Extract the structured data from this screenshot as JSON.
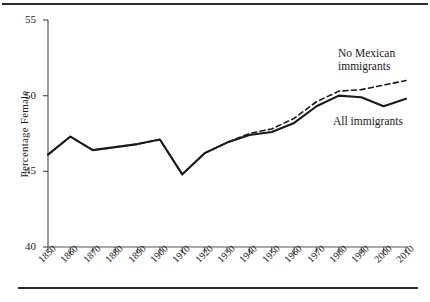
{
  "figure": {
    "ylabel": "Percentage Female",
    "ytick_labels": [
      "40",
      "45",
      "50",
      "55"
    ],
    "xtick_labels": [
      "1850",
      "1860",
      "1870",
      "1880",
      "1890",
      "1900",
      "1910",
      "1920",
      "1930",
      "1940",
      "1950",
      "1960",
      "1970",
      "1980",
      "1990",
      "2000",
      "2010"
    ],
    "annotations": {
      "no_mexican_line1": "No Mexican",
      "no_mexican_line2": "immigrants",
      "all_immigrants": "All immigrants"
    },
    "colors": {
      "line": "#1a1a1a",
      "axis": "#555555",
      "rule": "#2b2b2b",
      "background": "#ffffff"
    }
  },
  "chart_data": {
    "type": "line",
    "title": "",
    "xlabel": "",
    "ylabel": "Percentage Female",
    "xlim": [
      1850,
      2010
    ],
    "ylim": [
      40,
      55
    ],
    "yticks": [
      40,
      45,
      50,
      55
    ],
    "grid": false,
    "legend": "inline-annotations",
    "x": [
      1850,
      1860,
      1870,
      1880,
      1890,
      1900,
      1910,
      1920,
      1930,
      1940,
      1950,
      1960,
      1970,
      1980,
      1990,
      2000,
      2010
    ],
    "series": [
      {
        "name": "All immigrants",
        "style": "solid",
        "values": [
          46.1,
          47.3,
          46.4,
          46.6,
          46.8,
          47.1,
          44.8,
          46.2,
          46.9,
          47.4,
          47.6,
          48.2,
          49.3,
          50.0,
          49.9,
          49.3,
          49.8
        ]
      },
      {
        "name": "No Mexican immigrants",
        "style": "dashed",
        "values": [
          46.1,
          47.3,
          46.4,
          46.6,
          46.8,
          47.1,
          44.8,
          46.2,
          46.9,
          47.5,
          47.8,
          48.5,
          49.6,
          50.3,
          50.4,
          50.7,
          51.0
        ]
      }
    ]
  }
}
